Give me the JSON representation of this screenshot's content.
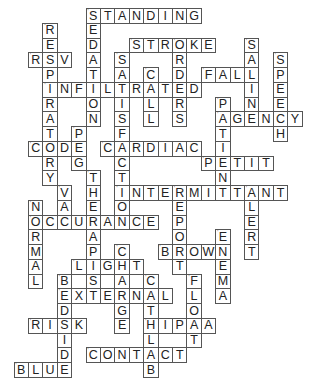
{
  "puzzle": {
    "type": "crossword",
    "grid": {
      "origin_x": 13.6,
      "origin_y": 8,
      "cell_w": 14.4,
      "cell_h": 14.75
    },
    "colors": {
      "border": "#555555",
      "letter": "#222222",
      "background": "#ffffff"
    },
    "across": [
      {
        "word": "STANDING",
        "row": 0,
        "col": 5
      },
      {
        "word": "STROKE",
        "row": 2,
        "col": 8
      },
      {
        "word": "RSV",
        "row": 3,
        "col": 1
      },
      {
        "word": "FALL",
        "row": 4,
        "col": 13
      },
      {
        "word": "INFILTRATED",
        "row": 5,
        "col": 2
      },
      {
        "word": "AGENCY",
        "row": 7,
        "col": 14
      },
      {
        "word": "CODE",
        "row": 9,
        "col": 1
      },
      {
        "word": "CARDIAC",
        "row": 9,
        "col": 6
      },
      {
        "word": "PETIT",
        "row": 10,
        "col": 13
      },
      {
        "word": "INTERMITTANT",
        "row": 12,
        "col": 7
      },
      {
        "word": "OCCURANCE",
        "row": 14,
        "col": 1
      },
      {
        "word": "BROWN",
        "row": 16,
        "col": 10
      },
      {
        "word": "LIGHT",
        "row": 17,
        "col": 4
      },
      {
        "word": "EXTERNAL",
        "row": 19,
        "col": 3
      },
      {
        "word": "RISK",
        "row": 21,
        "col": 1
      },
      {
        "word": "HIPAA",
        "row": 21,
        "col": 9
      },
      {
        "word": "CONTACT",
        "row": 23,
        "col": 5
      },
      {
        "word": "BLUE",
        "row": 24,
        "col": 0
      }
    ],
    "down": [
      {
        "word": "SEDATION",
        "row": 0,
        "col": 5
      },
      {
        "word": "RESPIRATORY",
        "row": 1,
        "col": 2
      },
      {
        "word": "ORDERS",
        "row": 2,
        "col": 11
      },
      {
        "word": "SALINE",
        "row": 2,
        "col": 16
      },
      {
        "word": "SATISFACTION",
        "row": 3,
        "col": 7
      },
      {
        "word": "SPEECH",
        "row": 3,
        "col": 18
      },
      {
        "word": "CALL",
        "row": 4,
        "col": 9
      },
      {
        "word": "PATIENT",
        "row": 6,
        "col": 14
      },
      {
        "word": "PEG",
        "row": 8,
        "col": 4
      },
      {
        "word": "THERAPIST",
        "row": 11,
        "col": 5
      },
      {
        "word": "VAC",
        "row": 12,
        "col": 3
      },
      {
        "word": "REPORT",
        "row": 12,
        "col": 11
      },
      {
        "word": "ALERT",
        "row": 12,
        "col": 16
      },
      {
        "word": "NORMAL",
        "row": 13,
        "col": 1
      },
      {
        "word": "ENEMA",
        "row": 15,
        "col": 14
      },
      {
        "word": "CHARGE",
        "row": 16,
        "col": 7
      },
      {
        "word": "BEDSIDE",
        "row": 18,
        "col": 3
      },
      {
        "word": "CATHLAB",
        "row": 18,
        "col": 9
      },
      {
        "word": "FLOAT",
        "row": 18,
        "col": 12
      }
    ]
  }
}
